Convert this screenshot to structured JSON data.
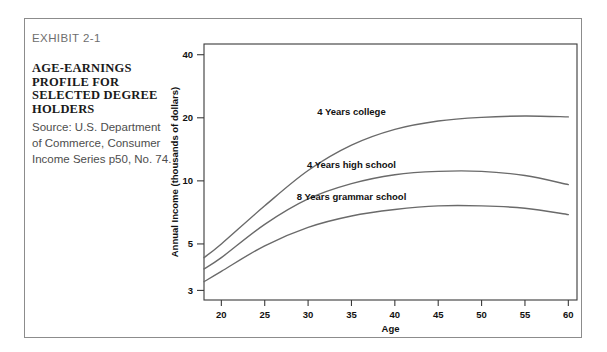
{
  "exhibit": {
    "label": "EXHIBIT 2-1",
    "title": "AGE-EARNINGS PROFILE FOR SELECTED DEGREE HOLDERS",
    "source": "Source: U.S. Department of Commerce, Consumer Income Series p50, No. 74."
  },
  "colors": {
    "frame": "#8c8c8c",
    "axis": "#3a3a3a",
    "curve": "#6a6a6a",
    "text": "#111111",
    "muted": "#6e6e6e"
  },
  "chart_data": {
    "type": "line",
    "title": "AGE-EARNINGS PROFILE FOR SELECTED DEGREE HOLDERS",
    "xlabel": "Age",
    "ylabel": "Annual Income (thousands of dollars)",
    "yscale": "log",
    "xlim": [
      18,
      61
    ],
    "ylim": [
      2.7,
      45
    ],
    "grid": false,
    "legend": "inline-labels",
    "xticks": [
      20,
      25,
      30,
      35,
      40,
      45,
      50,
      55,
      60
    ],
    "yticks": [
      3,
      5,
      10,
      20,
      40
    ],
    "x": [
      18,
      20,
      25,
      30,
      35,
      40,
      45,
      50,
      55,
      60
    ],
    "series": [
      {
        "name": "4 Years college",
        "label": "4 Years college",
        "values": [
          4.3,
          5.0,
          7.6,
          11.2,
          14.8,
          17.6,
          19.3,
          20.1,
          20.4,
          20.2
        ]
      },
      {
        "name": "4 Years high school",
        "label": "4 Years high school",
        "values": [
          3.8,
          4.3,
          6.2,
          8.2,
          9.7,
          10.7,
          11.1,
          11.1,
          10.6,
          9.6
        ]
      },
      {
        "name": "8 Years grammar school",
        "label": "8 Years grammar school",
        "values": [
          3.3,
          3.7,
          4.9,
          6.0,
          6.8,
          7.3,
          7.6,
          7.6,
          7.4,
          6.9
        ]
      }
    ],
    "annotations": [
      {
        "text": "4 Years college",
        "x": 35,
        "y": 21.5
      },
      {
        "text": "4 Years high school",
        "x": 35,
        "y": 12.0
      },
      {
        "text": "8 Years grammar school",
        "x": 35,
        "y": 8.4
      }
    ]
  }
}
